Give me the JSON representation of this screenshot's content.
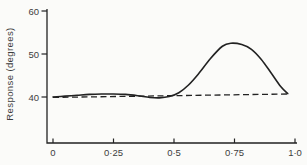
{
  "figure": {
    "background": "#fbfbf9",
    "line_color": "#222222",
    "text_color": "#3d3d3d"
  },
  "chart_data": {
    "type": "line",
    "title": "",
    "xlabel": "",
    "ylabel": "Response  (degrees)",
    "grid": false,
    "legend": "none",
    "xlim": [
      0,
      1.0
    ],
    "ylim": [
      29.5,
      60.5
    ],
    "y_ticks": {
      "values": [
        60,
        50,
        40
      ],
      "labels": [
        "60",
        "50",
        "40"
      ]
    },
    "x_ticks": {
      "values": [
        0,
        0.25,
        0.5,
        0.75,
        1.0
      ],
      "labels": [
        "0",
        "0·25",
        "0·5",
        "0·75",
        "1·0"
      ]
    },
    "series": [
      {
        "name": "response-curve",
        "style": "solid",
        "x": [
          0,
          0.05,
          0.1,
          0.15,
          0.2,
          0.25,
          0.3,
          0.35,
          0.4,
          0.44,
          0.48,
          0.52,
          0.56,
          0.6,
          0.65,
          0.7,
          0.735,
          0.78,
          0.82,
          0.86,
          0.9,
          0.94,
          0.97
        ],
        "y": [
          40.0,
          40.2,
          40.4,
          40.6,
          40.7,
          40.7,
          40.6,
          40.3,
          39.9,
          39.8,
          40.1,
          41.0,
          42.8,
          45.3,
          48.9,
          51.8,
          52.5,
          52.2,
          51.1,
          48.8,
          45.7,
          42.5,
          40.8
        ]
      },
      {
        "name": "baseline-dashed",
        "style": "dashed",
        "x": [
          0,
          0.97
        ],
        "y": [
          39.9,
          40.7
        ]
      }
    ]
  }
}
